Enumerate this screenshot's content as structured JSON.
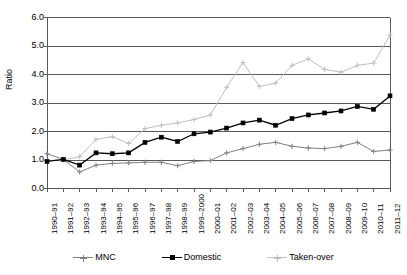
{
  "chart_data": {
    "type": "line",
    "title": "",
    "xlabel": "",
    "ylabel": "Ratio",
    "ylim": [
      0.0,
      6.0
    ],
    "ytick_values": [
      0.0,
      1.0,
      2.0,
      3.0,
      4.0,
      5.0,
      6.0
    ],
    "ytick_labels": [
      "0.0",
      "1.0",
      "2.0",
      "3.0",
      "4.0",
      "5.0",
      "6.0"
    ],
    "grid": true,
    "grid_axis": "y",
    "legend_position": "bottom",
    "categories": [
      "1990–91",
      "1991–92",
      "1992–93",
      "1993–94",
      "1994–95",
      "1995–96",
      "1996–97",
      "1997–98",
      "1998–99",
      "1999–2000",
      "2000–01",
      "2001–02",
      "2002–03",
      "2003–04",
      "2004–05",
      "2005–06",
      "2006–07",
      "2007–08",
      "2008–09",
      "2009–10",
      "2010–11",
      "2011–12"
    ],
    "series": [
      {
        "name": "MNC",
        "color": "#808080",
        "marker": "plus",
        "values": [
          1.22,
          1.02,
          0.58,
          0.82,
          0.88,
          0.9,
          0.92,
          0.92,
          0.8,
          0.95,
          0.98,
          1.25,
          1.4,
          1.55,
          1.62,
          1.48,
          1.42,
          1.4,
          1.48,
          1.62,
          1.3,
          1.35
        ]
      },
      {
        "name": "Domestic",
        "color": "#000000",
        "marker": "square",
        "values": [
          0.95,
          1.02,
          0.82,
          1.25,
          1.22,
          1.25,
          1.62,
          1.8,
          1.65,
          1.92,
          1.98,
          2.12,
          2.3,
          2.4,
          2.22,
          2.45,
          2.58,
          2.65,
          2.72,
          2.88,
          2.78,
          3.25
        ]
      },
      {
        "name": "Taken-over",
        "color": "#bfbfbf",
        "marker": "plus",
        "values": [
          0.98,
          1.0,
          1.12,
          1.72,
          1.82,
          1.58,
          2.1,
          2.22,
          2.3,
          2.42,
          2.58,
          3.55,
          4.42,
          3.58,
          3.7,
          4.32,
          4.55,
          4.18,
          4.08,
          4.32,
          4.4,
          5.38
        ]
      }
    ]
  },
  "legend": {
    "items": [
      {
        "label": "MNC"
      },
      {
        "label": "Domestic"
      },
      {
        "label": "Taken-over"
      }
    ]
  }
}
